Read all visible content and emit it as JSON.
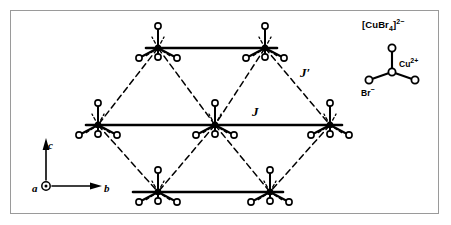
{
  "figure": {
    "background_color": "#ffffff",
    "frame_color": "#9a9a9a",
    "line_color": "#000000"
  },
  "couplings": [
    {
      "symbol": "J",
      "name": "intrachain-exchange",
      "line_style": "solid",
      "x": 252,
      "y": 105
    },
    {
      "symbol": "J′",
      "name": "interchain-exchange",
      "line_style": "dashed",
      "x": 300,
      "y": 66
    }
  ],
  "axes": {
    "name": "crystallographic-axes",
    "origin": {
      "x": 46,
      "y": 186
    },
    "a": {
      "label": "a",
      "direction": "out-of-plane",
      "glyph": "circle-dot"
    },
    "b": {
      "label": "b",
      "direction": "right",
      "length": 50
    },
    "c": {
      "label": "c",
      "direction": "up",
      "length": 42
    }
  },
  "inset": {
    "name": "cubr4-tetrahedron",
    "formula": "[CuBr₄]²⁻",
    "formula_parts": {
      "base": "[CuBr",
      "sub": "4",
      "sup": "2−",
      "close": "]"
    },
    "center_atom": {
      "label": "Cu²⁺",
      "element": "Cu",
      "charge": "2+"
    },
    "ligand_atom": {
      "label": "Br⁻",
      "element": "Br",
      "charge": "−"
    },
    "center": {
      "x": 392,
      "y": 72
    },
    "ligands": [
      {
        "x": 392,
        "y": 48
      },
      {
        "x": 369,
        "y": 80
      },
      {
        "x": 415,
        "y": 80
      },
      {
        "x": 392,
        "y": 72
      }
    ]
  },
  "lattice": {
    "name": "triangular-lattice",
    "node_label": "CuBr4 unit",
    "rows": [
      {
        "name": "top-chain",
        "y": 48,
        "nodes_x": [
          158,
          265
        ]
      },
      {
        "name": "middle-chain",
        "y": 125,
        "nodes_x": [
          98,
          215,
          330
        ]
      },
      {
        "name": "bottom-chain",
        "y": 192,
        "nodes_x": [
          158,
          270
        ]
      }
    ],
    "chain_bonds": [
      {
        "name": "J-bond-top",
        "x1": 146,
        "x2": 277,
        "y": 48
      },
      {
        "name": "J-bond-middle",
        "x1": 86,
        "x2": 342,
        "y": 125
      },
      {
        "name": "J-bond-bottom",
        "x1": 133,
        "x2": 283,
        "y": 192
      }
    ],
    "diagonal_bonds": [
      {
        "name": "Jp-bond",
        "x1": 158,
        "y1": 48,
        "x2": 98,
        "y2": 125
      },
      {
        "name": "Jp-bond",
        "x1": 158,
        "y1": 48,
        "x2": 215,
        "y2": 125
      },
      {
        "name": "Jp-bond",
        "x1": 265,
        "y1": 48,
        "x2": 215,
        "y2": 125
      },
      {
        "name": "Jp-bond",
        "x1": 265,
        "y1": 48,
        "x2": 330,
        "y2": 125
      },
      {
        "name": "Jp-bond",
        "x1": 98,
        "y1": 125,
        "x2": 158,
        "y2": 192
      },
      {
        "name": "Jp-bond",
        "x1": 215,
        "y1": 125,
        "x2": 158,
        "y2": 192
      },
      {
        "name": "Jp-bond",
        "x1": 215,
        "y1": 125,
        "x2": 270,
        "y2": 192
      },
      {
        "name": "Jp-bond",
        "x1": 330,
        "y1": 125,
        "x2": 270,
        "y2": 192
      }
    ],
    "node_geometry": {
      "stem_up_length": 22,
      "lower_bond_dx": 19,
      "lower_bond_dy": 10,
      "below_circle_dy": 9,
      "circle_radius": 3.1,
      "center_radius": 2.6
    }
  }
}
